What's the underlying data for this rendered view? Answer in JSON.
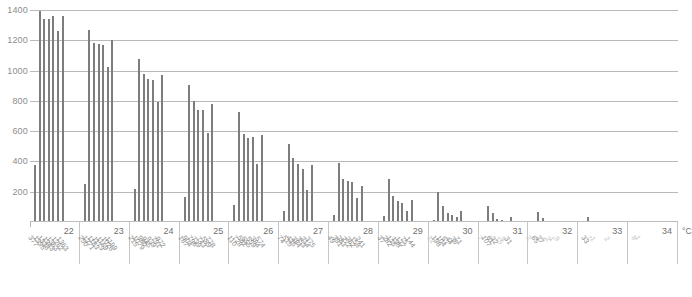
{
  "chart_data": {
    "type": "bar",
    "title": "",
    "xlabel": "°C",
    "ylabel": "",
    "ylim": [
      0,
      1400
    ],
    "yticks": [
      200,
      400,
      600,
      800,
      1000,
      1200,
      1400
    ],
    "grid": true,
    "legend": "none",
    "axis_unit": "°C",
    "categories": [
      "22",
      "23",
      "24",
      "25",
      "26",
      "27",
      "28",
      "29",
      "30",
      "31",
      "32",
      "33",
      "34"
    ],
    "bars_per_group": 7,
    "groups": [
      {
        "name": "22",
        "values": [
          377,
          1395,
          1338,
          1343,
          1363,
          1262,
          1363
        ]
      },
      {
        "name": "23",
        "values": [
          250,
          1271,
          1183,
          1173,
          1169,
          1026,
          1199
        ]
      },
      {
        "name": "24",
        "values": [
          215,
          1079,
          980,
          945,
          939,
          791,
          972
        ]
      },
      {
        "name": "25",
        "values": [
          167,
          904,
          796,
          739,
          743,
          589,
          778
        ]
      },
      {
        "name": "26",
        "values": [
          110,
          728,
          582,
          555,
          559,
          384,
          574
        ]
      },
      {
        "name": "27",
        "values": [
          74,
          515,
          425,
          384,
          353,
          214,
          375
        ]
      },
      {
        "name": "28",
        "values": [
          49,
          391,
          283,
          272,
          262,
          158,
          241
        ]
      },
      {
        "name": "29",
        "values": [
          37,
          282,
          175,
          138,
          127,
          75,
          144
        ]
      },
      {
        "name": "30",
        "values": [
          12,
          198,
          104,
          57,
          44,
          36,
          71
        ]
      },
      {
        "name": "31",
        "values": [
          7,
          107,
          61,
          22,
          15,
          9,
          31
        ]
      },
      {
        "name": "32",
        "values": [
          2,
          65,
          27,
          4,
          2,
          1,
          9
        ]
      },
      {
        "name": "33",
        "values": [
          0,
          33,
          7,
          1,
          0,
          0,
          2
        ]
      },
      {
        "name": "34",
        "values": [
          0,
          8,
          1,
          0,
          0,
          0,
          0
        ]
      }
    ],
    "data_labels": [
      {
        "group": "22",
        "labels": [
          "377",
          "1395",
          "1338",
          "1343",
          "1363",
          "1262",
          "1363"
        ]
      },
      {
        "group": "23",
        "labels": [
          "250",
          "1271",
          "1183",
          "1173",
          "1169",
          "1026",
          "1199"
        ]
      },
      {
        "group": "24",
        "labels": [
          "215",
          "1079",
          "980",
          "945",
          "939",
          "791",
          "972"
        ]
      },
      {
        "group": "25",
        "labels": [
          "167",
          "904",
          "796",
          "739",
          "743",
          "589",
          "778"
        ]
      },
      {
        "group": "26",
        "labels": [
          "110",
          "728",
          "582",
          "555",
          "559",
          "384",
          "574"
        ]
      },
      {
        "group": "27",
        "labels": [
          "74",
          "515",
          "425",
          "384",
          "353",
          "214",
          "375"
        ]
      },
      {
        "group": "28",
        "labels": [
          "49",
          "391",
          "283",
          "272",
          "262",
          "158",
          "241"
        ]
      },
      {
        "group": "29",
        "labels": [
          "37",
          "282",
          "175",
          "138",
          "127",
          "75",
          "144"
        ]
      },
      {
        "group": "30",
        "labels": [
          "12",
          "198",
          "104",
          "57",
          "44",
          "36",
          "71"
        ]
      },
      {
        "group": "31",
        "labels": [
          "7",
          "107",
          "61",
          "22",
          "15",
          "9",
          "31"
        ]
      },
      {
        "group": "32",
        "labels": [
          "2",
          "65",
          "27",
          "4",
          "2",
          "1",
          "9"
        ]
      },
      {
        "group": "33",
        "labels": [
          "",
          "33",
          "7",
          "1",
          "",
          "",
          "2"
        ]
      },
      {
        "group": "34",
        "labels": [
          "",
          "8",
          "1",
          "",
          "",
          "",
          ""
        ]
      }
    ]
  },
  "colors": {
    "bar": "#7d7d7d",
    "grid": "#b9b9b9",
    "tick_text": "#8d8d8d",
    "label_text": "#8a8a8a",
    "label_faint": "#c4c4c4",
    "background": "#ffffff"
  }
}
